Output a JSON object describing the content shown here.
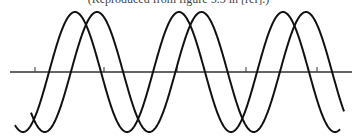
{
  "caption": "(Reproduced from figure 5.3 in [ref].)",
  "diagram": {
    "type": "two phase-shifted sine waves on a horizontal axis",
    "axis": {
      "y": 72,
      "x_start": 10,
      "x_end": 352,
      "ticks_x": [
        35,
        104,
        177,
        246,
        317
      ],
      "tick_height": 5
    },
    "waves": [
      {
        "name": "wave-1",
        "amplitude": 60,
        "period": 104,
        "first_peak_x": 75,
        "x_start": 15,
        "x_end": 340
      },
      {
        "name": "wave-2",
        "amplitude": 60,
        "period": 104.5,
        "first_peak_x": 97,
        "x_start": 31,
        "x_end": 344
      }
    ],
    "stroke_color": "#111111",
    "axis_color": "#333333"
  }
}
